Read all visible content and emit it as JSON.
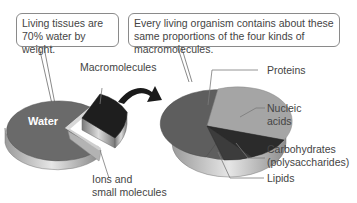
{
  "callouts": {
    "left": "Living tissues are 70% water by weight.",
    "right": "Every living organism contains about these same proportions of the four kinds of macromolecules."
  },
  "left_pie": {
    "slices": [
      {
        "name": "Water",
        "label": "Water",
        "percent": 70,
        "color": "#6a6a6a"
      },
      {
        "name": "Macromolecules",
        "label": "Macromolecules",
        "percent": 26,
        "color": "#1e1e1e",
        "exploded": true
      },
      {
        "name": "Ions and small molecules",
        "label": "Ions and small molecules",
        "percent": 4,
        "color": "#b0b0b0"
      }
    ]
  },
  "right_pie": {
    "slices": [
      {
        "name": "Proteins",
        "label": "Proteins",
        "color": "#5e5e5e"
      },
      {
        "name": "Nucleic acids",
        "label": "Nucleic acids",
        "color": "#a5a5a5"
      },
      {
        "name": "Carbohydrates (polysaccharides)",
        "label": "Carbohydrates (polysaccharides)",
        "color": "#2b2b2b"
      },
      {
        "name": "Lipids",
        "label": "Lipids",
        "color": "#3c3c3c"
      }
    ]
  },
  "labels": {
    "water": "Water",
    "macromolecules": "Macromolecules",
    "ions_line1": "Ions and",
    "ions_line2": "small molecules",
    "proteins": "Proteins",
    "nucleic_line1": "Nucleic",
    "nucleic_line2": "acids",
    "carbs_line1": "Carbohydrates",
    "carbs_line2": "(polysaccharides)",
    "lipids": "Lipids"
  }
}
